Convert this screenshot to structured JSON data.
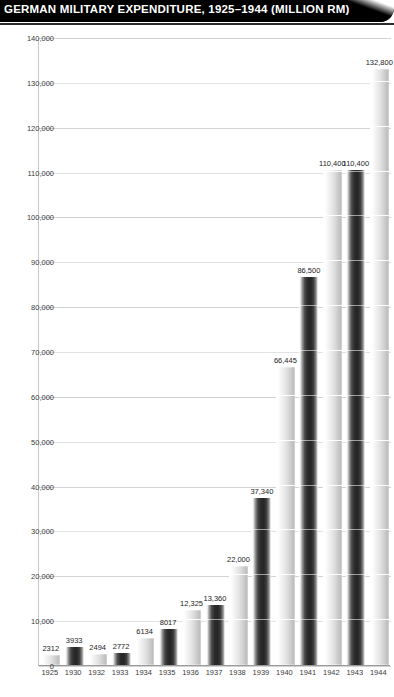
{
  "header": {
    "title": "GERMAN MILITARY EXPENDITURE, 1925–1944 (MILLION RM)"
  },
  "chart_data": {
    "type": "bar",
    "title": "GERMAN MILITARY EXPENDITURE, 1925–1944 (MILLION RM)",
    "xlabel": "",
    "ylabel": "",
    "ylim": [
      0,
      140000
    ],
    "grid": true,
    "legend": "none",
    "categories": [
      "1925",
      "1930",
      "1932",
      "1933",
      "1934",
      "1935",
      "1936",
      "1937",
      "1938",
      "1939",
      "1940",
      "1941",
      "1942",
      "1943",
      "1944"
    ],
    "values": [
      2312,
      3933,
      2494,
      2772,
      6134,
      8017,
      12325,
      13360,
      22000,
      37340,
      66445,
      86500,
      110400,
      110400,
      132800
    ],
    "value_labels": [
      "2312",
      "3933",
      "2494",
      "2772",
      "6134",
      "8017",
      "12,325",
      "13,360",
      "22,000",
      "37,340",
      "66,445",
      "86,500",
      "110,400",
      "110,400",
      "132,800"
    ],
    "bar_styles": [
      "light",
      "dark",
      "light",
      "dark",
      "light",
      "dark",
      "light",
      "dark",
      "light",
      "dark",
      "light",
      "dark",
      "light",
      "dark",
      "light"
    ],
    "yticks": [
      0,
      10000,
      20000,
      30000,
      40000,
      50000,
      60000,
      70000,
      80000,
      90000,
      100000,
      110000,
      120000,
      130000,
      140000
    ],
    "ytick_labels": [
      "0",
      "10,000",
      "20,000",
      "30,000",
      "40,000",
      "50,000",
      "60,000",
      "70,000",
      "80,000",
      "90,000",
      "100,000",
      "110,000",
      "120,000",
      "130,000",
      "140,000"
    ],
    "colors": {
      "header_bg": "#000000",
      "header_text": "#ffffff",
      "gridline": "#e2e2e2",
      "axis": "#9a9a9a",
      "tick_text": "#3a3a3a",
      "bar_light": "#e4e4e4",
      "bar_dark": "#2a2a2a"
    }
  }
}
